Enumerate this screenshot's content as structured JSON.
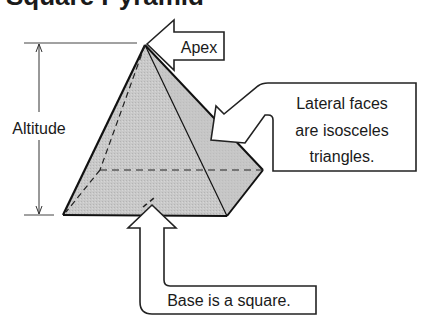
{
  "title": "Square Pyramid",
  "labels": {
    "altitude": "Altitude",
    "apex": "Apex",
    "lateral_line1": "Lateral faces",
    "lateral_line2": "are isosceles",
    "lateral_line3": "triangles.",
    "base": "Base is a square."
  },
  "colors": {
    "face_fill": "#c8c8c8",
    "stroke": "#1a1a1a",
    "background": "#ffffff"
  }
}
